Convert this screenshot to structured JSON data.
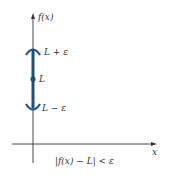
{
  "diagram": {
    "y_axis_label": "f(x)",
    "x_axis_label": "x",
    "upper_label": "L + ε",
    "center_label": "L",
    "lower_label": "L − ε",
    "caption": "|f(x) − L| < ε",
    "colors": {
      "interval": "#1f4e79",
      "axis": "#333333"
    }
  }
}
